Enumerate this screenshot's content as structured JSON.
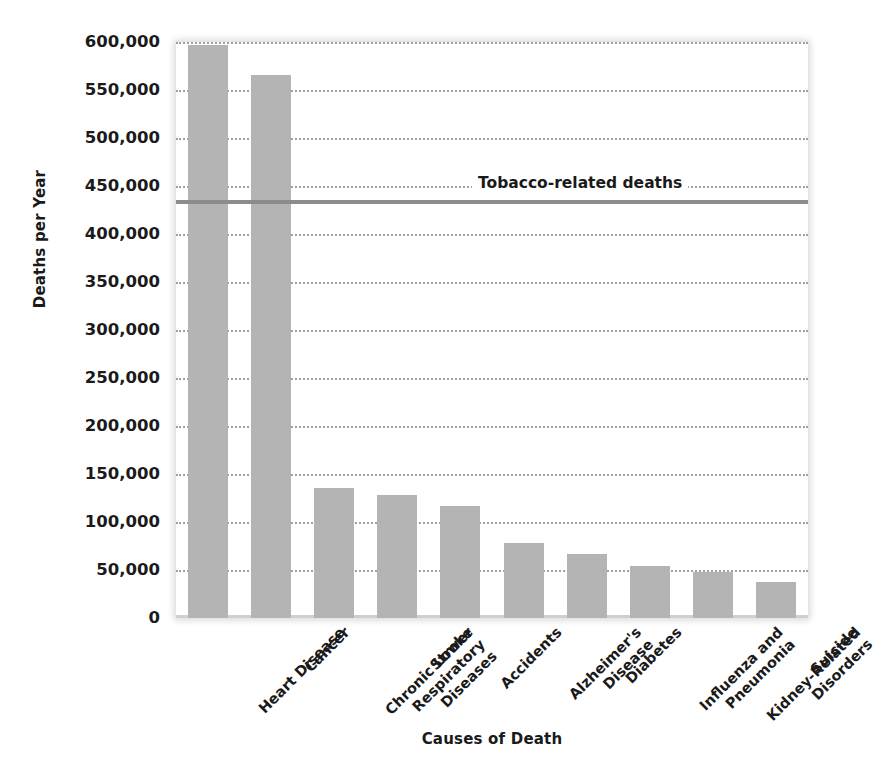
{
  "chart_data": {
    "type": "bar",
    "title": "",
    "xlabel": "Causes of Death",
    "ylabel": "Deaths per Year",
    "categories": [
      "Heart Disease",
      "Cancer",
      "Chronic Lower\nRespiratory\nDiseases",
      "Stroke",
      "Accidents",
      "Alzheimer's\nDisease",
      "Diabetes",
      "Influenza and\nPneumonia",
      "Kidney-Related\nDisorders",
      "Suicide"
    ],
    "values": [
      597000,
      566000,
      135000,
      128000,
      117000,
      78000,
      67000,
      54000,
      48000,
      38000
    ],
    "ylim": [
      0,
      600000
    ],
    "ytick_values": [
      0,
      50000,
      100000,
      150000,
      200000,
      250000,
      300000,
      350000,
      400000,
      450000,
      500000,
      550000,
      600000
    ],
    "ytick_labels": [
      "0",
      "50,000",
      "100,000",
      "150,000",
      "200,000",
      "250,000",
      "300,000",
      "350,000",
      "400,000",
      "450,000",
      "500,000",
      "550,000",
      "600,000"
    ],
    "grid": true,
    "grid_style": "dotted-horizontal",
    "legend": "none",
    "bar_color": "#b4b4b4",
    "annotations": [
      {
        "label": "Tobacco-related deaths",
        "type": "horizontal-reference-line",
        "value": 435000,
        "color": "#8c8c8c"
      }
    ]
  }
}
